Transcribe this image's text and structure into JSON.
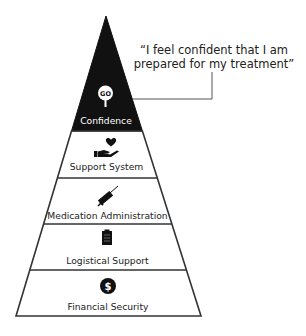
{
  "diagram": {
    "type": "pyramid",
    "colors": {
      "top_fill": "#111111",
      "outline": "#333333",
      "text": "#222222",
      "background": "#ffffff"
    },
    "callout": {
      "line1": "“I feel confident that I am",
      "line2": "prepared for my treatment”"
    },
    "levels": [
      {
        "label": "Confidence",
        "icon": "go-pin-icon",
        "icon_text": "GO"
      },
      {
        "label": "Support System",
        "icon": "heart-in-hand-icon"
      },
      {
        "label": "Medication Administration",
        "icon": "syringe-icon"
      },
      {
        "label": "Logistical Support",
        "icon": "clipboard-icon"
      },
      {
        "label": "Financial Security",
        "icon": "dollar-circle-icon",
        "icon_text": "$"
      }
    ]
  }
}
